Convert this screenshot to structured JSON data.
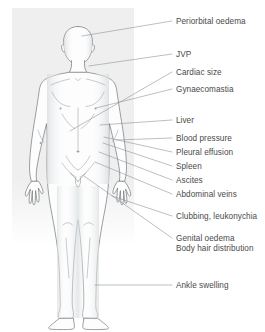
{
  "diagram": {
    "background_tint": "#f0f0f0",
    "outline_color": "#6f7478",
    "leader_color": "#8c9195",
    "text_color": "#4a4a4a",
    "body_fill": "#fdfdfd",
    "shading_color": "#e3e6e8"
  },
  "callouts": [
    {
      "id": "periorbital-oedema",
      "label": "Periorbital oedema",
      "label_x": 176,
      "label_y": 17,
      "leader": {
        "x1": 82,
        "y1": 36,
        "x2": 172,
        "y2": 21
      },
      "anchor_region": "eye / orbit"
    },
    {
      "id": "jvp",
      "label": "JVP",
      "label_x": 176,
      "label_y": 50,
      "leader": {
        "x1": 89,
        "y1": 66,
        "x2": 172,
        "y2": 54
      },
      "anchor_region": "neck / jugular vein"
    },
    {
      "id": "cardiac-size",
      "label": "Cardiac size",
      "label_x": 176,
      "label_y": 68,
      "leader": {
        "x1": 70,
        "y1": 131,
        "x2": 172,
        "y2": 72
      },
      "anchor_region": "praecordium"
    },
    {
      "id": "gynaecomastia",
      "label": "Gynaecomastia",
      "label_x": 176,
      "label_y": 85,
      "leader": {
        "x1": 96,
        "y1": 108,
        "x2": 172,
        "y2": 89
      },
      "anchor_region": "chest / breast"
    },
    {
      "id": "liver",
      "label": "Liver",
      "label_x": 176,
      "label_y": 116,
      "leader": {
        "x1": 100,
        "y1": 125,
        "x2": 172,
        "y2": 120
      },
      "anchor_region": "right upper quadrant"
    },
    {
      "id": "blood-pressure",
      "label": "Blood pressure",
      "label_x": 176,
      "label_y": 134,
      "leader": {
        "x1": 116,
        "y1": 140,
        "x2": 172,
        "y2": 138
      },
      "anchor_region": "upper arm"
    },
    {
      "id": "pleural-effusion",
      "label": "Pleural effusion",
      "label_x": 176,
      "label_y": 148,
      "leader": {
        "x1": 104,
        "y1": 137,
        "x2": 172,
        "y2": 152
      },
      "anchor_region": "lung base"
    },
    {
      "id": "spleen",
      "label": "Spleen",
      "label_x": 176,
      "label_y": 162,
      "leader": {
        "x1": 103,
        "y1": 143,
        "x2": 172,
        "y2": 166
      },
      "anchor_region": "left upper quadrant"
    },
    {
      "id": "ascites",
      "label": "Ascites",
      "label_x": 176,
      "label_y": 176,
      "leader": {
        "x1": 99,
        "y1": 152,
        "x2": 172,
        "y2": 180
      },
      "anchor_region": "abdomen"
    },
    {
      "id": "abdominal-veins",
      "label": "Abdominal veins",
      "label_x": 176,
      "label_y": 190,
      "leader": {
        "x1": 95,
        "y1": 162,
        "x2": 172,
        "y2": 194
      },
      "anchor_region": "abdominal wall"
    },
    {
      "id": "clubbing-leukonychia",
      "label": "Clubbing, leukonychia",
      "label_x": 176,
      "label_y": 212,
      "leader": {
        "x1": 112,
        "y1": 196,
        "x2": 172,
        "y2": 216
      },
      "anchor_region": "fingernails"
    },
    {
      "id": "genital-oedema",
      "label": "Genital oedema",
      "label_x": 176,
      "label_y": 234,
      "leader": {
        "x1": 84,
        "y1": 176,
        "x2": 172,
        "y2": 238
      },
      "anchor_region": "genitalia"
    },
    {
      "id": "body-hair-distribution",
      "label": "Body hair distribution",
      "label_x": 176,
      "label_y": 244,
      "leader": null,
      "anchor_region": "genitalia / pubic region"
    },
    {
      "id": "ankle-swelling",
      "label": "Ankle swelling",
      "label_x": 176,
      "label_y": 281,
      "leader": {
        "x1": 95,
        "y1": 285,
        "x2": 172,
        "y2": 285
      },
      "anchor_region": "ankle"
    }
  ]
}
